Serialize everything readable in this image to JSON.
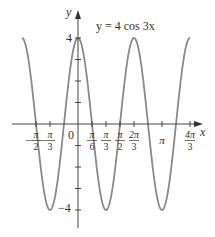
{
  "chart_data": {
    "type": "line",
    "title": "y = 4 cos 3x",
    "equation": "y = 4 cos 3x",
    "xlabel": "x",
    "ylabel": "y",
    "x_range": [
      -2.094,
      4.189
    ],
    "ylim": [
      -4,
      4
    ],
    "grid": false,
    "x_ticks": [
      {
        "value": -1.5708,
        "label_num": "π",
        "label_den": "2",
        "neg": true
      },
      {
        "value": -1.0472,
        "label_num": "π",
        "label_den": "3",
        "neg": true
      },
      {
        "value": 0,
        "label": "0"
      },
      {
        "value": 0.5236,
        "label_num": "π",
        "label_den": "6",
        "neg": false
      },
      {
        "value": 1.0472,
        "label_num": "π",
        "label_den": "3",
        "neg": false
      },
      {
        "value": 1.5708,
        "label_num": "π",
        "label_den": "2",
        "neg": false
      },
      {
        "value": 2.0944,
        "label_num": "2π",
        "label_den": "3",
        "neg": false
      },
      {
        "value": 3.1416,
        "label": "π"
      },
      {
        "value": 4.1888,
        "label_num": "4π",
        "label_den": "3",
        "neg": false
      }
    ],
    "y_ticks": [
      {
        "value": 4,
        "label": "4"
      },
      {
        "value": 3,
        "label": ""
      },
      {
        "value": 2,
        "label": ""
      },
      {
        "value": 1,
        "label": ""
      },
      {
        "value": -1,
        "label": ""
      },
      {
        "value": -2,
        "label": ""
      },
      {
        "value": -3,
        "label": ""
      },
      {
        "value": -4,
        "label": "−4"
      }
    ],
    "key_points": [
      {
        "x": "-2π/3",
        "y": 4
      },
      {
        "x": "-π/3",
        "y": -4
      },
      {
        "x": "0",
        "y": 4
      },
      {
        "x": "π/3",
        "y": -4
      },
      {
        "x": "2π/3",
        "y": 4
      },
      {
        "x": "π",
        "y": -4
      },
      {
        "x": "4π/3",
        "y": 4
      }
    ],
    "amplitude": 4,
    "period": "2π/3",
    "curve_color": "#8a8a8a",
    "axis_color": "#444444"
  },
  "labels": {
    "equation": "y = 4 cos 3x",
    "x_axis": "x",
    "y_axis": "y",
    "y_top": "4",
    "y_bottom": "−4",
    "origin": "0",
    "pi": "π"
  }
}
